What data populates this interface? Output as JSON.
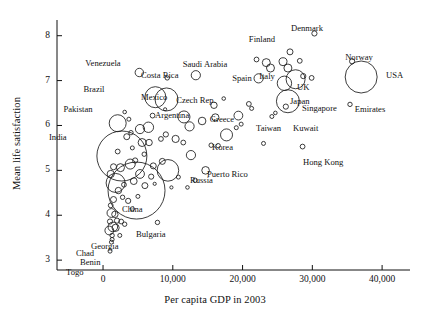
{
  "chart_data": {
    "type": "scatter",
    "title": "",
    "xlabel": "Per capita GDP in 2003",
    "ylabel": "Mean life satisfaction",
    "xlim": [
      -6600,
      44000
    ],
    "ylim": [
      2.78,
      8.35
    ],
    "xticks": [
      0,
      10000,
      20000,
      30000,
      40000
    ],
    "xtick_labels": [
      "0",
      "10,000",
      "20,000",
      "30,000",
      "40,000"
    ],
    "yticks": [
      3,
      4,
      5,
      6,
      7,
      8
    ],
    "ytick_labels": [
      "3",
      "4",
      "5",
      "6",
      "7",
      "8"
    ],
    "grid": false,
    "legend": false,
    "marker": "open-circle",
    "size_encodes": "population",
    "stroke_color": "#1a1a1a",
    "fill_color": "none",
    "labeled_points": [
      {
        "name": "Venezuela",
        "x": 5200,
        "y": 7.18,
        "r": 4.2,
        "lx": 103,
        "ly": 59,
        "anchor": "middle"
      },
      {
        "name": "Costa Rica",
        "x": 9200,
        "y": 7.06,
        "r": 2.2,
        "lx": 141,
        "ly": 71,
        "anchor": "start"
      },
      {
        "name": "Brazil",
        "x": 7500,
        "y": 6.63,
        "r": 10.5,
        "lx": 94,
        "ly": 85,
        "anchor": "middle"
      },
      {
        "name": "Mexico",
        "x": 9100,
        "y": 6.58,
        "r": 11.5,
        "lx": 141,
        "ly": 93,
        "anchor": "start"
      },
      {
        "name": "Saudi Arabia",
        "x": 13300,
        "y": 7.12,
        "r": 4.6,
        "lx": 205,
        "ly": 60,
        "anchor": "middle"
      },
      {
        "name": "Spain",
        "x": 22300,
        "y": 7.05,
        "r": 4.6,
        "lx": 242,
        "ly": 74,
        "anchor": "middle"
      },
      {
        "name": "Italy",
        "x": 26000,
        "y": 6.94,
        "r": 7.2,
        "lx": 267,
        "ly": 72,
        "anchor": "middle"
      },
      {
        "name": "Finland",
        "x": 26800,
        "y": 7.64,
        "r": 3.0,
        "lx": 262,
        "ly": 35,
        "anchor": "middle"
      },
      {
        "name": "Denmark",
        "x": 30300,
        "y": 8.05,
        "r": 2.6,
        "lx": 307,
        "ly": 24,
        "anchor": "middle"
      },
      {
        "name": "Norway",
        "x": 35700,
        "y": 7.43,
        "r": 2.6,
        "lx": 359,
        "ly": 53,
        "anchor": "middle"
      },
      {
        "name": "USA",
        "x": 37000,
        "y": 7.08,
        "r": 16.0,
        "lx": 386,
        "ly": 71,
        "anchor": "start"
      },
      {
        "name": "UK",
        "x": 27600,
        "y": 7.03,
        "r": 9.5,
        "lx": 297,
        "ly": 83,
        "anchor": "start"
      },
      {
        "name": "Japan",
        "x": 26500,
        "y": 6.54,
        "r": 11.5,
        "lx": 290,
        "ly": 97,
        "anchor": "start"
      },
      {
        "name": "Singapore",
        "x": 26200,
        "y": 6.42,
        "r": 2.6,
        "lx": 302,
        "ly": 104,
        "anchor": "start"
      },
      {
        "name": "Emirates",
        "x": 35400,
        "y": 6.47,
        "r": 2.2,
        "lx": 370,
        "ly": 105,
        "anchor": "middle"
      },
      {
        "name": "Czech Rep.",
        "x": 15900,
        "y": 6.45,
        "r": 3.2,
        "lx": 196,
        "ly": 96,
        "anchor": "middle"
      },
      {
        "name": "Argentina",
        "x": 11600,
        "y": 6.19,
        "r": 6.0,
        "lx": 155,
        "ly": 111,
        "anchor": "start"
      },
      {
        "name": "Greece",
        "x": 19400,
        "y": 6.22,
        "r": 4.4,
        "lx": 222,
        "ly": 115,
        "anchor": "middle"
      },
      {
        "name": "Taiwan",
        "x": 24200,
        "y": 6.2,
        "r": 2.0,
        "lx": 256,
        "ly": 124,
        "anchor": "start"
      },
      {
        "name": "Kuwait",
        "x": 19800,
        "y": 6.03,
        "r": 2.0,
        "lx": 293,
        "ly": 124,
        "anchor": "start"
      },
      {
        "name": "Korea",
        "x": 17700,
        "y": 5.79,
        "r": 6.0,
        "lx": 212,
        "ly": 143,
        "anchor": "start"
      },
      {
        "name": "Hong Kong",
        "x": 28600,
        "y": 5.53,
        "r": 2.4,
        "lx": 303,
        "ly": 158,
        "anchor": "start"
      },
      {
        "name": "Puerto Rico",
        "x": 16500,
        "y": 5.55,
        "r": 2.2,
        "lx": 207,
        "ly": 170,
        "anchor": "start"
      },
      {
        "name": "Russia",
        "x": 9300,
        "y": 5.0,
        "r": 10.8,
        "lx": 190,
        "ly": 176,
        "anchor": "start"
      },
      {
        "name": "Pakistan",
        "x": 2100,
        "y": 6.05,
        "r": 8.5,
        "lx": 78,
        "ly": 105,
        "anchor": "middle"
      },
      {
        "name": "India",
        "x": 2700,
        "y": 5.32,
        "r": 25.0,
        "lx": 49,
        "ly": 133,
        "anchor": "start"
      },
      {
        "name": "China",
        "x": 4800,
        "y": 4.55,
        "r": 28.5,
        "lx": 122,
        "ly": 205,
        "anchor": "start"
      },
      {
        "name": "Bulgaria",
        "x": 7800,
        "y": 3.84,
        "r": 2.2,
        "lx": 136,
        "ly": 230,
        "anchor": "start"
      },
      {
        "name": "Georgia",
        "x": 3100,
        "y": 3.8,
        "r": 2.2,
        "lx": 91,
        "ly": 242,
        "anchor": "start"
      },
      {
        "name": "Chad",
        "x": 1300,
        "y": 3.55,
        "r": 2.2,
        "lx": 76,
        "ly": 249,
        "anchor": "start"
      },
      {
        "name": "Benin",
        "x": 1200,
        "y": 3.4,
        "r": 2.0,
        "lx": 80,
        "ly": 258,
        "anchor": "start"
      },
      {
        "name": "Togo",
        "x": 1000,
        "y": 3.2,
        "r": 2.0,
        "lx": 66,
        "ly": 268,
        "anchor": "start"
      }
    ],
    "unlabeled_points": [
      {
        "x": 23400,
        "y": 7.4,
        "r": 4.0
      },
      {
        "x": 24000,
        "y": 7.28,
        "r": 4.0
      },
      {
        "x": 25800,
        "y": 7.42,
        "r": 4.0
      },
      {
        "x": 26500,
        "y": 7.28,
        "r": 4.0
      },
      {
        "x": 28200,
        "y": 7.44,
        "r": 2.4
      },
      {
        "x": 28700,
        "y": 7.1,
        "r": 2.6
      },
      {
        "x": 29900,
        "y": 7.06,
        "r": 2.4
      },
      {
        "x": 22000,
        "y": 7.47,
        "r": 2.4
      },
      {
        "x": 20900,
        "y": 6.48,
        "r": 2.4
      },
      {
        "x": 16100,
        "y": 6.18,
        "r": 3.6
      },
      {
        "x": 14200,
        "y": 6.1,
        "r": 3.8
      },
      {
        "x": 12400,
        "y": 5.98,
        "r": 4.6
      },
      {
        "x": 19100,
        "y": 5.95,
        "r": 2.0
      },
      {
        "x": 21300,
        "y": 6.38,
        "r": 2.0
      },
      {
        "x": 11500,
        "y": 5.62,
        "r": 2.4
      },
      {
        "x": 10400,
        "y": 5.7,
        "r": 3.6
      },
      {
        "x": 9000,
        "y": 5.8,
        "r": 2.6
      },
      {
        "x": 8300,
        "y": 5.7,
        "r": 2.4
      },
      {
        "x": 12600,
        "y": 5.34,
        "r": 4.6
      },
      {
        "x": 14700,
        "y": 5.0,
        "r": 3.8
      },
      {
        "x": 8500,
        "y": 5.2,
        "r": 3.0
      },
      {
        "x": 7200,
        "y": 5.1,
        "r": 3.0
      },
      {
        "x": 10800,
        "y": 4.85,
        "r": 2.0
      },
      {
        "x": 13200,
        "y": 4.78,
        "r": 2.2
      },
      {
        "x": 6500,
        "y": 5.96,
        "r": 5.2
      },
      {
        "x": 5300,
        "y": 5.92,
        "r": 4.6
      },
      {
        "x": 5600,
        "y": 5.62,
        "r": 4.0
      },
      {
        "x": 6600,
        "y": 5.62,
        "r": 3.2
      },
      {
        "x": 4000,
        "y": 5.84,
        "r": 2.2
      },
      {
        "x": 3400,
        "y": 5.75,
        "r": 3.0
      },
      {
        "x": 3700,
        "y": 6.14,
        "r": 2.0
      },
      {
        "x": 7100,
        "y": 6.22,
        "r": 2.4
      },
      {
        "x": 4600,
        "y": 5.22,
        "r": 2.6
      },
      {
        "x": 3900,
        "y": 5.14,
        "r": 5.0
      },
      {
        "x": 2500,
        "y": 5.06,
        "r": 4.0
      },
      {
        "x": 1500,
        "y": 5.08,
        "r": 3.0
      },
      {
        "x": 1100,
        "y": 4.92,
        "r": 3.6
      },
      {
        "x": 1800,
        "y": 4.72,
        "r": 9.5
      },
      {
        "x": 2200,
        "y": 4.55,
        "r": 3.2
      },
      {
        "x": 1500,
        "y": 4.35,
        "r": 3.0
      },
      {
        "x": 1100,
        "y": 4.22,
        "r": 2.4
      },
      {
        "x": 1200,
        "y": 4.05,
        "r": 4.4
      },
      {
        "x": 1700,
        "y": 4.02,
        "r": 3.2
      },
      {
        "x": 1000,
        "y": 3.86,
        "r": 2.6
      },
      {
        "x": 1400,
        "y": 3.74,
        "r": 4.8
      },
      {
        "x": 1800,
        "y": 3.72,
        "r": 3.6
      },
      {
        "x": 900,
        "y": 3.66,
        "r": 4.4
      },
      {
        "x": 2000,
        "y": 3.88,
        "r": 2.6
      },
      {
        "x": 2600,
        "y": 3.86,
        "r": 2.4
      },
      {
        "x": 1300,
        "y": 3.46,
        "r": 2.0
      },
      {
        "x": 5300,
        "y": 4.92,
        "r": 4.4
      },
      {
        "x": 4400,
        "y": 4.76,
        "r": 3.4
      },
      {
        "x": 6000,
        "y": 4.66,
        "r": 3.0
      },
      {
        "x": 3000,
        "y": 4.68,
        "r": 2.4
      },
      {
        "x": 2800,
        "y": 4.4,
        "r": 2.2
      },
      {
        "x": 3600,
        "y": 4.32,
        "r": 2.6
      },
      {
        "x": 4200,
        "y": 4.14,
        "r": 2.2
      },
      {
        "x": 5000,
        "y": 4.42,
        "r": 2.0
      },
      {
        "x": 9800,
        "y": 4.62,
        "r": 1.6
      },
      {
        "x": 7400,
        "y": 4.7,
        "r": 1.6
      },
      {
        "x": 3100,
        "y": 6.3,
        "r": 1.8
      },
      {
        "x": 8900,
        "y": 6.36,
        "r": 1.6
      },
      {
        "x": 17300,
        "y": 6.6,
        "r": 1.8
      },
      {
        "x": 24700,
        "y": 6.28,
        "r": 1.8
      },
      {
        "x": 23000,
        "y": 5.6,
        "r": 2.0
      },
      {
        "x": 15500,
        "y": 5.56,
        "r": 2.2
      },
      {
        "x": 12100,
        "y": 4.62,
        "r": 1.8
      },
      {
        "x": 2100,
        "y": 5.42,
        "r": 2.4
      },
      {
        "x": 5900,
        "y": 5.36,
        "r": 2.2
      },
      {
        "x": 4200,
        "y": 5.5,
        "r": 2.0
      },
      {
        "x": 6900,
        "y": 4.86,
        "r": 2.6
      },
      {
        "x": 2400,
        "y": 3.55,
        "r": 2.0
      }
    ]
  }
}
